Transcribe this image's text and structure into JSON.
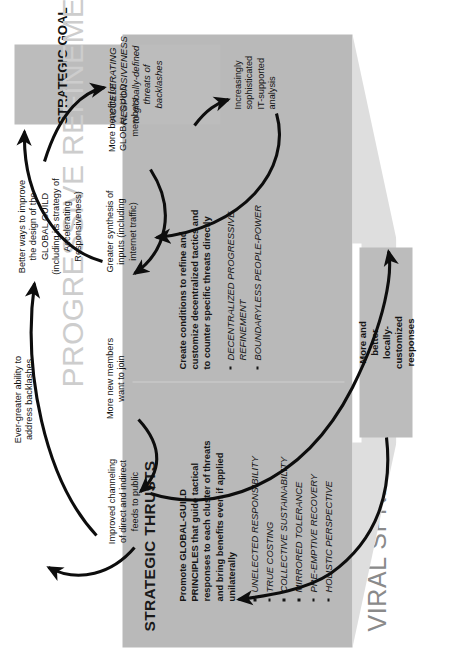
{
  "diagram": {
    "section_title": "VIRAL SPREAD",
    "panel_title": "STRATEGIC THRUSTS",
    "watermark": "PROGRESSIVE REFINEMENT"
  },
  "thrusts": [
    {
      "lead": "Promote GLOBAL-GUILD PRINCIPLES that guide tactical responses to each cluster of threats and bring benefits even if applied unilaterally",
      "bullets": [
        "UNELECTED RESPONSIBILITY",
        "TRUE COSTING",
        "COLLECTIVE SUSTAINABILITY",
        "MIRRORED TOLERANCE",
        "PRE-EMPTIVE RECOVERY",
        "HOLISTIC PERSPECTIVE"
      ]
    },
    {
      "lead": "Create conditions to refine and customize decentralized tactics and to counter specific threats directly",
      "bullets": [
        "DECENTRALIZED PROGRESSIVE REFINEMENT",
        "BOUNDARYLESS PEOPLE-POWER"
      ]
    }
  ],
  "responses_box": {
    "label": "More and\nbetter\nlocally-\ncustomized\nresponses"
  },
  "goal": {
    "title": "STRATEGIC GOAL",
    "subtitle": "ACCELERATING RESPONSIVENESS\nto globally-defined threats of backlashes"
  },
  "cycle_nodes": [
    {
      "id": "better",
      "label": "Better ways to improve\nthe design of the\nGLOBAL GUILD\n(including its strategy of\nAccelerating\nResponsiveness)"
    },
    {
      "id": "benefits",
      "label": "More benefits for\nGLOBAL GUILD\nmembers"
    },
    {
      "id": "synth",
      "label": "Greater synthesis of\ninputs (including\ninternet traffic)"
    },
    {
      "id": "analysis",
      "label": "Increasingly\nsophisticated\nIT-supported\nanalysis"
    },
    {
      "id": "members",
      "label": "More new members\nwant to join"
    },
    {
      "id": "improved",
      "label": "Improved channeling\nof direct and indirect\nfeeds to public"
    },
    {
      "id": "ever",
      "label": "Ever-greater ability to\naddress backlashes"
    }
  ],
  "colors": {
    "panel_gray": "#b9b9b9",
    "funnel_gray": "#dedede",
    "box_gray": "#bcbcbc",
    "watermark_gray": "#cdcdcd",
    "title_gray": "#8a8a8a",
    "ink": "#141414"
  }
}
